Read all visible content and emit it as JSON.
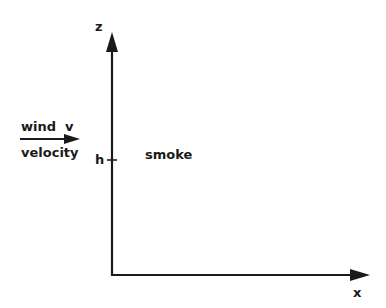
{
  "diagram": {
    "axes": {
      "z_label": "z",
      "x_label": "x"
    },
    "height_marker": "h",
    "wind": {
      "line1": "wind  v",
      "line2": "velocity"
    },
    "source_label": "smoke",
    "colors": {
      "ink": "#1a1a1a",
      "background": "#ffffff"
    }
  }
}
